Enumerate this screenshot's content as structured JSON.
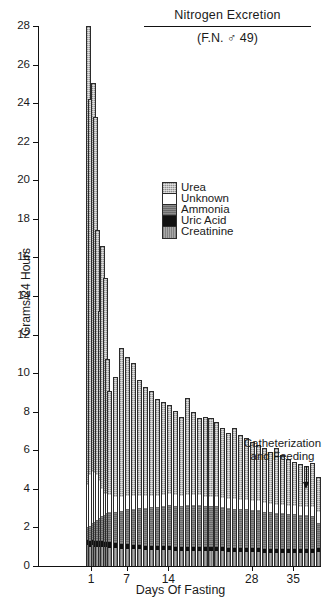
{
  "chart_data": {
    "type": "bar",
    "subtype": "stacked-bar",
    "title": "Nitrogen Excretion",
    "subtitle": "(F.N. ♂ 49)",
    "xlabel": "Days Of Fasting",
    "ylabel": "Grams/24 Hours",
    "ylim": [
      0,
      28
    ],
    "ytick_values": [
      0,
      2,
      4,
      6,
      8,
      10,
      12,
      14,
      16,
      18,
      20,
      22,
      24,
      26,
      28
    ],
    "ytick_labels": [
      "0",
      "2",
      "4",
      "6",
      "8",
      "10",
      "12",
      "14",
      "16",
      "18",
      "20",
      "22",
      "24",
      "26",
      "28"
    ],
    "xtick_values": [
      1,
      7,
      14,
      28,
      35
    ],
    "xtick_labels": [
      "1",
      "7",
      "14",
      "28",
      "35"
    ],
    "grid": false,
    "legend_position": "inside-upper-right",
    "legend": [
      {
        "name": "Urea",
        "color": "#bcbcbc",
        "pattern": "cross-hatch"
      },
      {
        "name": "Unknown",
        "color": "#ffffff",
        "pattern": "solid-white"
      },
      {
        "name": "Ammonia",
        "color": "#8d8d8d",
        "pattern": "horizontal-hatch"
      },
      {
        "name": "Uric Acid",
        "color": "#111111",
        "pattern": "solid-black"
      },
      {
        "name": "Creatinine",
        "color": "#a8a8a8",
        "pattern": "vertical-hatch"
      }
    ],
    "annotations": [
      {
        "text_line1": "Catheterization",
        "text_line2": "and Feeding",
        "points_to_day": 37,
        "arrow": "down"
      }
    ],
    "stack_order_bottom_to_top": [
      "Creatinine",
      "Uric Acid",
      "Ammonia",
      "Unknown",
      "Urea"
    ],
    "x": [
      0.4,
      0.8,
      1.2,
      1.6,
      2.0,
      2.4,
      2.8,
      3.2,
      3.6,
      4.0,
      5,
      6,
      7,
      8,
      9,
      10,
      11,
      12,
      13,
      14,
      15,
      16,
      17,
      18,
      19,
      20,
      21,
      22,
      23,
      24,
      25,
      26,
      27,
      28,
      29,
      30,
      31,
      32,
      33,
      34,
      35,
      36,
      37,
      38,
      39
    ],
    "series": [
      {
        "name": "Creatinine",
        "values": [
          1.1,
          1.0,
          1.1,
          1.0,
          1.0,
          1.0,
          1.0,
          1.0,
          1.0,
          0.95,
          0.95,
          0.9,
          0.9,
          0.9,
          0.9,
          0.85,
          0.85,
          0.85,
          0.85,
          0.85,
          0.8,
          0.8,
          0.8,
          0.8,
          0.8,
          0.8,
          0.8,
          0.8,
          0.8,
          0.75,
          0.75,
          0.75,
          0.75,
          0.75,
          0.75,
          0.7,
          0.7,
          0.7,
          0.7,
          0.7,
          0.7,
          0.7,
          0.7,
          0.7,
          0.75
        ]
      },
      {
        "name": "Uric Acid",
        "values": [
          0.25,
          0.3,
          0.25,
          0.3,
          0.3,
          0.3,
          0.3,
          0.25,
          0.25,
          0.3,
          0.25,
          0.25,
          0.25,
          0.2,
          0.2,
          0.2,
          0.2,
          0.2,
          0.2,
          0.2,
          0.2,
          0.2,
          0.2,
          0.2,
          0.2,
          0.2,
          0.2,
          0.2,
          0.2,
          0.2,
          0.2,
          0.2,
          0.2,
          0.2,
          0.2,
          0.2,
          0.2,
          0.2,
          0.2,
          0.2,
          0.2,
          0.2,
          0.2,
          0.2,
          0.2
        ]
      },
      {
        "name": "Ammonia",
        "values": [
          0.65,
          0.8,
          0.9,
          1.0,
          1.1,
          1.2,
          1.3,
          1.4,
          1.5,
          1.55,
          1.6,
          1.7,
          1.8,
          1.85,
          1.9,
          1.95,
          2.0,
          2.0,
          2.05,
          2.1,
          2.1,
          2.1,
          2.15,
          2.15,
          2.15,
          2.1,
          2.1,
          2.1,
          2.05,
          2.05,
          2.0,
          2.0,
          2.0,
          1.95,
          1.95,
          1.9,
          1.9,
          1.85,
          1.85,
          1.8,
          1.8,
          1.75,
          1.75,
          1.7,
          1.3
        ]
      },
      {
        "name": "Unknown",
        "values": [
          2.2,
          2.6,
          2.6,
          2.5,
          2.3,
          1.9,
          1.4,
          1.1,
          1.0,
          0.9,
          0.8,
          0.75,
          0.7,
          0.7,
          0.65,
          0.65,
          0.6,
          0.6,
          0.6,
          0.6,
          0.6,
          0.55,
          0.55,
          0.55,
          0.55,
          0.5,
          0.5,
          0.5,
          0.5,
          0.5,
          0.5,
          0.45,
          0.45,
          0.45,
          0.45,
          0.45,
          0.4,
          0.4,
          0.4,
          0.4,
          0.4,
          0.4,
          0.4,
          0.45,
          0.55
        ]
      },
      {
        "name": "Urea",
        "values": [
          23.8,
          19.5,
          20.2,
          18.5,
          12.7,
          8.8,
          12.6,
          11.2,
          7.0,
          5.4,
          6.2,
          7.7,
          7.2,
          6.9,
          6.0,
          5.65,
          5.4,
          5.0,
          4.8,
          4.6,
          4.35,
          4.1,
          5.0,
          4.3,
          3.95,
          4.15,
          4.05,
          3.85,
          3.6,
          3.4,
          3.7,
          3.4,
          3.25,
          3.1,
          2.95,
          2.85,
          2.7,
          2.95,
          2.6,
          2.45,
          2.3,
          2.25,
          2.15,
          2.3,
          1.8
        ]
      }
    ],
    "totals": [
      28.0,
      24.2,
      25.05,
      23.3,
      17.4,
      13.2,
      16.6,
      13.95,
      9.75,
      9.1,
      9.8,
      11.3,
      10.85,
      10.55,
      9.65,
      9.3,
      9.05,
      8.65,
      8.5,
      8.35,
      8.05,
      7.75,
      8.7,
      8.0,
      7.65,
      7.75,
      7.65,
      7.45,
      7.15,
      6.9,
      7.15,
      6.8,
      6.65,
      6.45,
      6.3,
      6.1,
      5.9,
      6.1,
      5.75,
      5.55,
      5.4,
      5.3,
      5.2,
      5.35,
      4.6
    ]
  }
}
